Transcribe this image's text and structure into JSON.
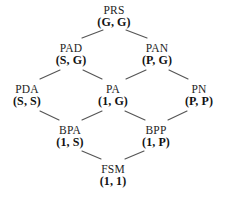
{
  "diagram": {
    "type": "hasse-lattice",
    "title": "",
    "background_color": "#ffffff",
    "edge_color": "#555555",
    "text_color": "#1a1a1a",
    "nodes": [
      {
        "id": "PRS",
        "name": "PRS",
        "pair": "(G, G)",
        "x": 114,
        "y": 4,
        "level": 0
      },
      {
        "id": "PAD",
        "name": "PAD",
        "pair": "(S, G)",
        "x": 71,
        "y": 42,
        "level": 1
      },
      {
        "id": "PAN",
        "name": "PAN",
        "pair": "(P, G)",
        "x": 157,
        "y": 42,
        "level": 1
      },
      {
        "id": "PDA",
        "name": "PDA",
        "pair": "(S, S)",
        "x": 27,
        "y": 83,
        "level": 2
      },
      {
        "id": "PA",
        "name": "PA",
        "pair": "(1, G)",
        "x": 113,
        "y": 83,
        "level": 2
      },
      {
        "id": "PN",
        "name": "PN",
        "pair": "(P, P)",
        "x": 199,
        "y": 83,
        "level": 2
      },
      {
        "id": "BPA",
        "name": "BPA",
        "pair": "(1, S)",
        "x": 70,
        "y": 124,
        "level": 3
      },
      {
        "id": "BPP",
        "name": "BPP",
        "pair": "(1, P)",
        "x": 156,
        "y": 124,
        "level": 3
      },
      {
        "id": "FSM",
        "name": "FSM",
        "pair": "(1, 1)",
        "x": 113,
        "y": 163,
        "level": 4
      }
    ],
    "edges": [
      {
        "from": "PRS",
        "to": "PAD",
        "x1": 103,
        "y1": 30,
        "x2": 82,
        "y2": 38
      },
      {
        "from": "PRS",
        "to": "PAN",
        "x1": 126,
        "y1": 30,
        "x2": 147,
        "y2": 38
      },
      {
        "from": "PAD",
        "to": "PDA",
        "x1": 60,
        "y1": 70,
        "x2": 40,
        "y2": 79
      },
      {
        "from": "PAD",
        "to": "PA",
        "x1": 83,
        "y1": 70,
        "x2": 102,
        "y2": 79
      },
      {
        "from": "PAN",
        "to": "PA",
        "x1": 146,
        "y1": 70,
        "x2": 126,
        "y2": 79
      },
      {
        "from": "PAN",
        "to": "PN",
        "x1": 169,
        "y1": 70,
        "x2": 188,
        "y2": 79
      },
      {
        "from": "PDA",
        "to": "BPA",
        "x1": 40,
        "y1": 111,
        "x2": 59,
        "y2": 120
      },
      {
        "from": "PA",
        "to": "BPA",
        "x1": 102,
        "y1": 111,
        "x2": 82,
        "y2": 120
      },
      {
        "from": "PA",
        "to": "BPP",
        "x1": 125,
        "y1": 111,
        "x2": 145,
        "y2": 120
      },
      {
        "from": "PN",
        "to": "BPP",
        "x1": 187,
        "y1": 111,
        "x2": 168,
        "y2": 120
      },
      {
        "from": "BPA",
        "to": "FSM",
        "x1": 82,
        "y1": 151,
        "x2": 101,
        "y2": 159
      },
      {
        "from": "BPP",
        "to": "FSM",
        "x1": 144,
        "y1": 151,
        "x2": 125,
        "y2": 159
      }
    ]
  }
}
